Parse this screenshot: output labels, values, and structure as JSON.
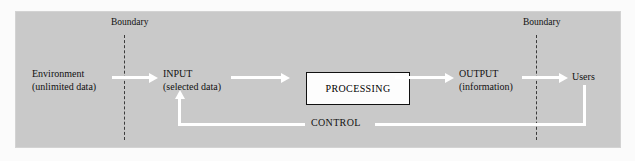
{
  "diagram": {
    "title_present": false,
    "background_color": "#c9c9c9",
    "line_color": "#ffffff",
    "text_color": "#111111",
    "boundary_line_color": "#3a3a3a",
    "box_fill": "#fdfdfd",
    "box_border": "#111111",
    "nodes": {
      "environment": {
        "line1": "Environment",
        "line2": "(unlimited data)"
      },
      "input": {
        "line1": "INPUT",
        "line2": "(selected data)"
      },
      "processing": {
        "label": "PROCESSING"
      },
      "output": {
        "line1": "OUTPUT",
        "line2": "(information)"
      },
      "users": {
        "label": "Users"
      }
    },
    "boundaries": {
      "left": {
        "label": "Boundary"
      },
      "right": {
        "label": "Boundary"
      }
    },
    "feedback": {
      "label": "CONTROL"
    },
    "flow_order": [
      "Environment (unlimited data)",
      "INPUT (selected data)",
      "PROCESSING",
      "OUTPUT (information)",
      "Users"
    ],
    "feedback_path": "Users -> CONTROL -> INPUT (selected data)"
  }
}
